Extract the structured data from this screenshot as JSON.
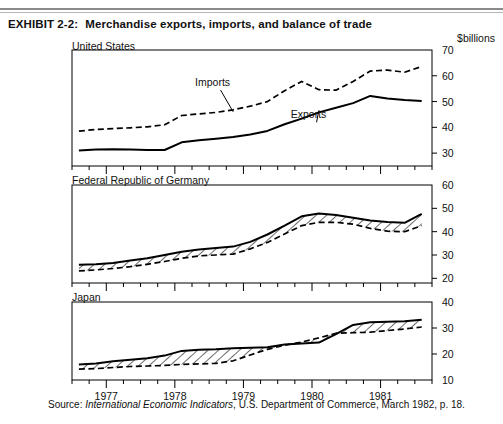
{
  "exhibit": {
    "label": "EXHIBIT 2-2:",
    "title": "Merchandise exports, imports, and balance of trade"
  },
  "units_label": "$billions",
  "source": {
    "prefix": "Source: ",
    "italic_title": "International Economic Indicators",
    "suffix": ", U.S. Department of Commerce, March 1982, p. 18."
  },
  "colors": {
    "line": "#000000",
    "rule": "#8a8a8a",
    "text": "#111111",
    "hatch": "#000000",
    "background": "#ffffff"
  },
  "chart_data": [
    {
      "type": "line",
      "title": "United States",
      "panel_label": "United States",
      "xlabel": "",
      "ylabel": "$billions",
      "ylim": [
        25,
        70
      ],
      "yticks": [
        30,
        40,
        50,
        60,
        70
      ],
      "ytick_labels": [
        "30",
        "40",
        "50",
        "60",
        "70"
      ],
      "xlim": [
        1976.5,
        1981.75
      ],
      "xticks": [
        1977,
        1978,
        1979,
        1980,
        1981
      ],
      "xtick_labels": [
        "1977",
        "1978",
        "1979",
        "1980",
        "1981"
      ],
      "minor_xticks_per_year": 4,
      "grid": false,
      "legend": "inline-annotations",
      "annotations": [
        {
          "text": "Imports",
          "x": 1978.55,
          "y": 56.0
        },
        {
          "text": "Exports",
          "x": 1979.95,
          "y": 43.5
        }
      ],
      "series": [
        {
          "name": "Imports",
          "style": "dashed",
          "x": [
            1976.6,
            1976.85,
            1977.1,
            1977.35,
            1977.6,
            1977.85,
            1978.1,
            1978.35,
            1978.6,
            1978.85,
            1979.1,
            1979.35,
            1979.6,
            1979.85,
            1980.1,
            1980.35,
            1980.6,
            1980.85,
            1981.1,
            1981.35,
            1981.6
          ],
          "y": [
            38.5,
            39.2,
            39.5,
            39.8,
            40.2,
            41.0,
            44.6,
            45.2,
            45.8,
            46.8,
            48.2,
            50.0,
            54.2,
            57.8,
            54.6,
            54.4,
            57.8,
            61.8,
            62.2,
            61.4,
            63.6
          ]
        },
        {
          "name": "Exports",
          "style": "solid",
          "x": [
            1976.6,
            1976.85,
            1977.1,
            1977.35,
            1977.6,
            1977.85,
            1978.1,
            1978.35,
            1978.6,
            1978.85,
            1979.1,
            1979.35,
            1979.6,
            1979.85,
            1980.1,
            1980.35,
            1980.6,
            1980.85,
            1981.1,
            1981.35,
            1981.6
          ],
          "y": [
            31.0,
            31.4,
            31.5,
            31.4,
            31.2,
            31.2,
            34.2,
            35.0,
            35.6,
            36.2,
            37.2,
            38.6,
            41.2,
            43.4,
            45.8,
            47.6,
            49.4,
            52.2,
            51.2,
            50.6,
            50.2
          ]
        }
      ]
    },
    {
      "type": "area",
      "title": "Federal Republic of Germany",
      "panel_label": "Federal Republic of Germany",
      "xlabel": "",
      "ylabel": "$billions",
      "ylim": [
        18,
        60
      ],
      "yticks": [
        20,
        30,
        40,
        50,
        60
      ],
      "ytick_labels": [
        "20",
        "30",
        "40",
        "50",
        "60"
      ],
      "xlim": [
        1976.5,
        1981.75
      ],
      "xticks": [
        1977,
        1978,
        1979,
        1980,
        1981
      ],
      "xtick_labels": [
        "1977",
        "1978",
        "1979",
        "1980",
        "1981"
      ],
      "minor_xticks_per_year": 4,
      "grid": false,
      "fill": "hatched",
      "series": [
        {
          "name": "Exports",
          "style": "solid",
          "x": [
            1976.6,
            1976.85,
            1977.1,
            1977.35,
            1977.6,
            1977.85,
            1978.1,
            1978.35,
            1978.6,
            1978.85,
            1979.1,
            1979.35,
            1979.6,
            1979.85,
            1980.1,
            1980.35,
            1980.6,
            1980.85,
            1981.1,
            1981.35,
            1981.6
          ],
          "y": [
            25.8,
            26.0,
            26.6,
            27.6,
            28.6,
            30.0,
            31.4,
            32.4,
            33.0,
            33.6,
            35.6,
            38.8,
            42.6,
            46.6,
            47.8,
            47.2,
            46.0,
            44.8,
            44.2,
            43.8,
            47.6
          ]
        },
        {
          "name": "Imports",
          "style": "dashed",
          "x": [
            1976.6,
            1976.85,
            1977.1,
            1977.35,
            1977.6,
            1977.85,
            1978.1,
            1978.35,
            1978.6,
            1978.85,
            1979.1,
            1979.35,
            1979.6,
            1979.85,
            1980.1,
            1980.35,
            1980.6,
            1980.85,
            1981.1,
            1981.35,
            1981.6
          ],
          "y": [
            23.2,
            23.6,
            24.2,
            25.0,
            26.0,
            27.2,
            28.6,
            29.6,
            30.0,
            30.4,
            32.6,
            35.4,
            39.0,
            42.6,
            44.0,
            44.0,
            43.2,
            41.4,
            40.2,
            40.0,
            42.6
          ]
        }
      ]
    },
    {
      "type": "area",
      "title": "Japan",
      "panel_label": "Japan",
      "xlabel": "",
      "ylabel": "$billions",
      "ylim": [
        10,
        40
      ],
      "yticks": [
        10,
        20,
        30,
        40
      ],
      "ytick_labels": [
        "10",
        "20",
        "30",
        "40"
      ],
      "xlim": [
        1976.5,
        1981.75
      ],
      "xticks": [
        1977,
        1978,
        1979,
        1980,
        1981
      ],
      "xtick_labels": [
        "1977",
        "1978",
        "1979",
        "1980",
        "1981"
      ],
      "minor_xticks_per_year": 4,
      "grid": false,
      "fill": "hatched",
      "series": [
        {
          "name": "Exports",
          "style": "solid",
          "x": [
            1976.6,
            1976.85,
            1977.1,
            1977.35,
            1977.6,
            1977.85,
            1978.1,
            1978.35,
            1978.6,
            1978.85,
            1979.1,
            1979.35,
            1979.6,
            1979.85,
            1980.1,
            1980.35,
            1980.6,
            1980.85,
            1981.1,
            1981.35,
            1981.6
          ],
          "y": [
            16.0,
            16.4,
            17.2,
            17.8,
            18.4,
            19.4,
            21.2,
            21.6,
            21.8,
            22.2,
            22.4,
            22.6,
            23.6,
            24.0,
            24.4,
            27.6,
            31.2,
            32.2,
            32.4,
            32.6,
            33.2
          ]
        },
        {
          "name": "Imports",
          "style": "dashed",
          "x": [
            1976.6,
            1976.85,
            1977.1,
            1977.35,
            1977.6,
            1977.85,
            1978.1,
            1978.35,
            1978.6,
            1978.85,
            1979.1,
            1979.35,
            1979.6,
            1979.85,
            1980.1,
            1980.35,
            1980.6,
            1980.85,
            1981.1,
            1981.35,
            1981.6
          ],
          "y": [
            14.2,
            14.4,
            14.8,
            15.2,
            15.4,
            15.6,
            16.0,
            16.2,
            16.4,
            17.4,
            19.6,
            21.8,
            23.4,
            24.6,
            26.2,
            28.0,
            28.2,
            28.4,
            29.0,
            29.6,
            30.4
          ]
        }
      ]
    }
  ]
}
